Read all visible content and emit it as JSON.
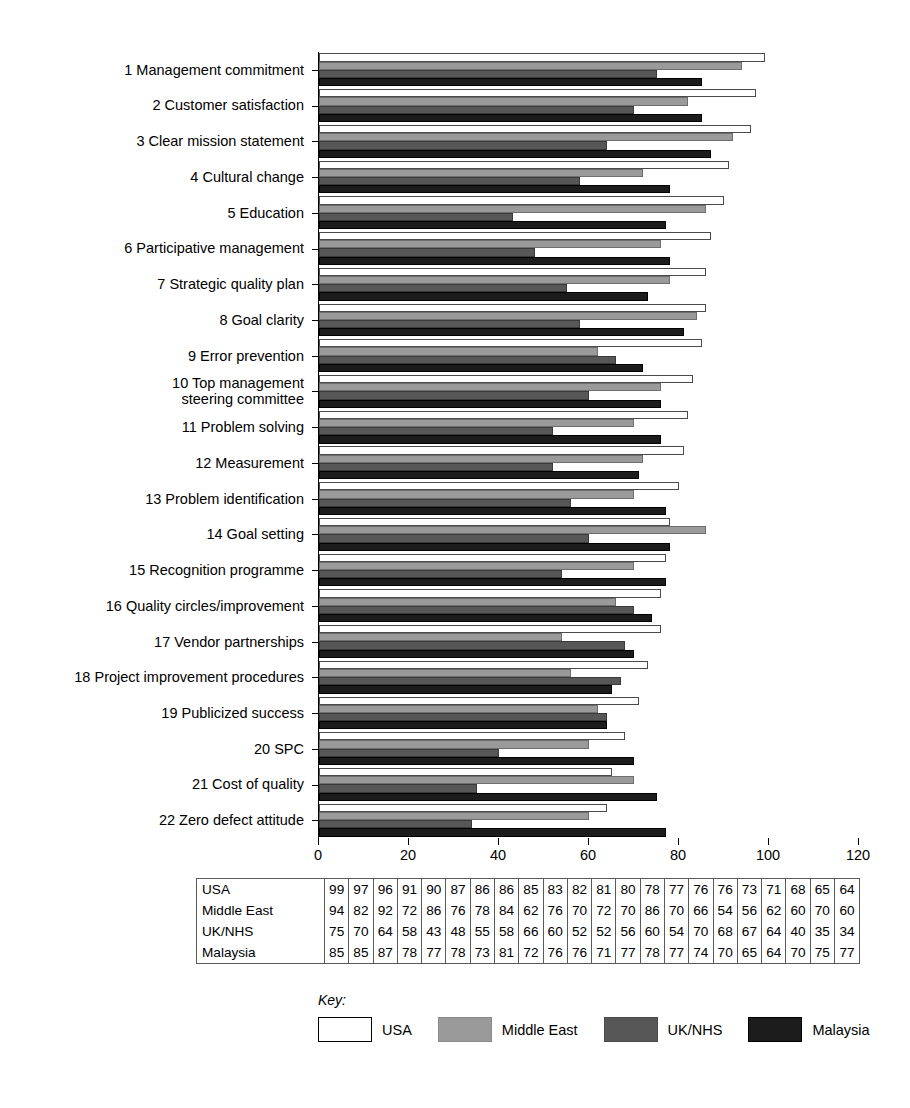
{
  "chart_data": {
    "type": "bar",
    "orientation": "horizontal",
    "title": "",
    "xlabel": "",
    "ylabel": "",
    "xlim": [
      0,
      120
    ],
    "xticks": [
      0,
      20,
      40,
      60,
      80,
      100,
      120
    ],
    "grid": false,
    "legend_position": "bottom",
    "legend_title": "Key:",
    "categories": [
      "1 Management commitment",
      "2 Customer satisfaction",
      "3 Clear mission statement",
      "4 Cultural change",
      "5 Education",
      "6 Participative management",
      "7 Strategic quality plan",
      "8 Goal clarity",
      "9 Error prevention",
      "10 Top management\nsteering committee",
      "11 Problem solving",
      "12 Measurement",
      "13 Problem identification",
      "14 Goal setting",
      "15 Recognition programme",
      "16 Quality circles/improvement",
      "17 Vendor partnerships",
      "18 Project improvement procedures",
      "19 Publicized success",
      "20 SPC",
      "21 Cost of quality",
      "22 Zero defect attitude"
    ],
    "series": [
      {
        "name": "USA",
        "color": "#ffffff",
        "values": [
          99,
          97,
          96,
          91,
          90,
          87,
          86,
          86,
          85,
          83,
          82,
          81,
          80,
          78,
          77,
          76,
          76,
          73,
          71,
          68,
          65,
          64
        ]
      },
      {
        "name": "Middle East",
        "color": "#9a9a9a",
        "values": [
          94,
          82,
          92,
          72,
          86,
          76,
          78,
          84,
          62,
          76,
          70,
          72,
          70,
          86,
          70,
          66,
          54,
          56,
          62,
          60,
          70,
          60
        ]
      },
      {
        "name": "UK/NHS",
        "color": "#575757",
        "values": [
          75,
          70,
          64,
          58,
          43,
          48,
          55,
          58,
          66,
          60,
          52,
          52,
          56,
          60,
          54,
          70,
          68,
          67,
          64,
          40,
          35,
          34
        ]
      },
      {
        "name": "Malaysia",
        "color": "#1c1c1c",
        "values": [
          85,
          85,
          87,
          78,
          77,
          78,
          73,
          81,
          72,
          76,
          76,
          71,
          77,
          78,
          77,
          74,
          70,
          65,
          64,
          70,
          75,
          77
        ]
      }
    ]
  },
  "table": {
    "row_labels": [
      "USA",
      "Middle East",
      "UK/NHS",
      "Malaysia"
    ],
    "rows": [
      [
        99,
        97,
        96,
        91,
        90,
        87,
        86,
        86,
        85,
        83,
        82,
        81,
        80,
        78,
        77,
        76,
        76,
        73,
        71,
        68,
        65,
        64
      ],
      [
        94,
        82,
        92,
        72,
        86,
        76,
        78,
        84,
        62,
        76,
        70,
        72,
        70,
        86,
        70,
        66,
        54,
        56,
        62,
        60,
        70,
        60
      ],
      [
        75,
        70,
        64,
        58,
        43,
        48,
        55,
        58,
        66,
        60,
        52,
        52,
        56,
        60,
        54,
        70,
        68,
        67,
        64,
        40,
        35,
        34
      ],
      [
        85,
        85,
        87,
        78,
        77,
        78,
        73,
        81,
        72,
        76,
        76,
        71,
        77,
        78,
        77,
        74,
        70,
        65,
        64,
        70,
        75,
        77
      ]
    ]
  },
  "legend": {
    "title": "Key:",
    "items": [
      {
        "label": "USA",
        "swatch": "usa"
      },
      {
        "label": "Middle East",
        "swatch": "middleeast"
      },
      {
        "label": "UK/NHS",
        "swatch": "uknhs"
      },
      {
        "label": "Malaysia",
        "swatch": "malaysia"
      }
    ]
  }
}
